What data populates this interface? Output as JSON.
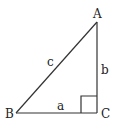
{
  "diagram": {
    "type": "right-triangle",
    "vertices": {
      "A": "A",
      "B": "B",
      "C": "C"
    },
    "sides": {
      "a": "a",
      "b": "b",
      "c": "c"
    },
    "right_angle_at": "C",
    "line_color": "#333333"
  }
}
